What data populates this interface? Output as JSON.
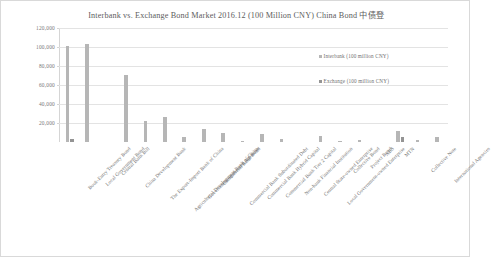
{
  "chart_data": {
    "type": "bar",
    "title": "Interbank vs. Exchange Bond Market 2016.12 (100 Million CNY) China Bond 中债登",
    "xlabel": "",
    "ylabel": "",
    "ylim": [
      0,
      120000
    ],
    "ytick_labels": [
      "120,000",
      "100,000",
      "80,000",
      "60,000",
      "40,000",
      "20,000"
    ],
    "ytick_values": [
      120000,
      100000,
      80000,
      60000,
      40000,
      20000
    ],
    "grid": true,
    "legend_position": "inside-right",
    "categories": [
      "Book-Entry Treasury Bond",
      "Local Government Bond",
      "Central Bank Bill",
      "China Development Bank",
      "The Export-Import Bank of China",
      "Agricultural Development Bank of China",
      "Government-sponsored Agencies",
      "Commercial Bank Bond",
      "Commercial Bank Subordinated Debt",
      "Commercial Bank Hybrid Capital",
      "Commercial Bank Tier 2 Capital",
      "Non-bank Financial Institution",
      "Central State-owned Enterprise",
      "Local Government-owned Enterprise",
      "Collective Bond",
      "Project Bond",
      "ABS",
      "MTN",
      "Collective Note",
      "International Agencies"
    ],
    "series": [
      {
        "name": "Interbank (100 million CNY)",
        "color": "#b6b6b6",
        "values": [
          101500,
          103000,
          0,
          70500,
          22000,
          26500,
          5000,
          13500,
          9000,
          1500,
          8000,
          3500,
          0,
          6500,
          1000,
          2000,
          0,
          12000,
          2500,
          5500
        ]
      },
      {
        "name": "Exchange (100 million CNY)",
        "color": "#949494",
        "values": [
          3500,
          0,
          0,
          0,
          0,
          0,
          0,
          0,
          0,
          0,
          0,
          0,
          0,
          0,
          0,
          0,
          0,
          5000,
          0,
          0
        ]
      }
    ]
  },
  "legend": {
    "items": [
      {
        "label": "Interbank (100 million CNY)",
        "color": "#b6b6b6"
      },
      {
        "label": "Exchange (100 million CNY)",
        "color": "#949494"
      }
    ]
  }
}
